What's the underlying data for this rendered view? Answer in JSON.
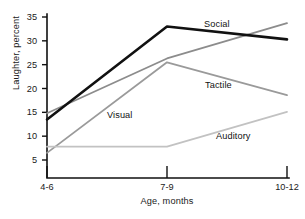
{
  "chart_data": {
    "type": "line",
    "title": "",
    "xlabel": "Age, months",
    "ylabel": "Laughter, percent",
    "categories": [
      "4-6",
      "7-9",
      "10-12"
    ],
    "x_tick_labels": [
      "4-6",
      "7-9",
      "10-12"
    ],
    "y_tick_labels": [
      "5",
      "10",
      "15",
      "20",
      "25",
      "30",
      "35"
    ],
    "y_ticks": [
      5,
      10,
      15,
      20,
      25,
      30,
      35
    ],
    "ylim": [
      0,
      35
    ],
    "grid": false,
    "legend_position": "inline-labels",
    "series": [
      {
        "name": "Social",
        "values": [
          13.5,
          33.0,
          30.3
        ],
        "color": "#111111",
        "width": 2.6,
        "label_x": 204,
        "label_y": 19
      },
      {
        "name": "Tactile",
        "values": [
          14.8,
          26.3,
          33.7
        ],
        "color": "#8c8c8c",
        "width": 1.8,
        "label_x": 205,
        "label_y": 80
      },
      {
        "name": "Visual",
        "values": [
          6.5,
          25.5,
          18.6
        ],
        "color": "#9a9a9a",
        "width": 1.8,
        "label_x": 107,
        "label_y": 110
      },
      {
        "name": "Auditory",
        "values": [
          7.8,
          7.8,
          15.1
        ],
        "color": "#c2c2c2",
        "width": 1.8,
        "label_x": 216,
        "label_y": 131
      }
    ],
    "annotations": [
      "Social",
      "Tactile",
      "Visual",
      "Auditory"
    ],
    "axis_color": "#111111"
  },
  "figure": {
    "caption": ""
  }
}
